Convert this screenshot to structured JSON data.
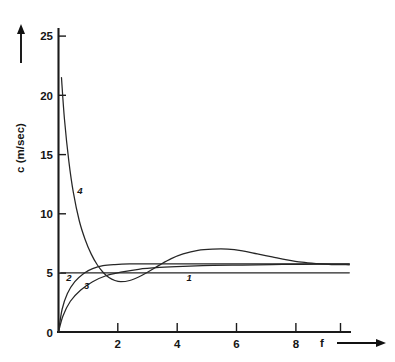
{
  "chart_data": {
    "type": "line",
    "title": "",
    "subtitle": "",
    "xlabel": "f",
    "ylabel": "c (m/sec)",
    "xlim": [
      0,
      11.2
    ],
    "ylim": [
      0,
      26.5
    ],
    "xticks": [
      0,
      2,
      4,
      6,
      8
    ],
    "xtick_labels": [
      "0",
      "2",
      "4",
      "6",
      "8"
    ],
    "yticks": [
      0,
      5,
      10,
      15,
      20,
      25
    ],
    "ytick_labels": [
      "0",
      "5",
      "10",
      "15",
      "20",
      "25"
    ],
    "grid": false,
    "legend_position": "inline-curve-labels",
    "axis_arrows": {
      "x": "right",
      "y": "up"
    },
    "series": [
      {
        "name": "1",
        "label": "1",
        "label_at": {
          "x": 4.4,
          "y": 4.35
        },
        "description": "constant horizontal line",
        "x": [
          0.08,
          1.0,
          2.0,
          3.0,
          4.0,
          5.0,
          6.0,
          7.0,
          8.0,
          9.0,
          9.8
        ],
        "y": [
          5.0,
          5.0,
          5.0,
          5.0,
          5.0,
          5.0,
          5.0,
          5.0,
          5.0,
          5.0,
          5.0
        ]
      },
      {
        "name": "2",
        "label": "2",
        "label_at": {
          "x": 0.35,
          "y": 4.3
        },
        "description": "steep rise from origin then plateau near 5.75",
        "x": [
          0.0,
          0.12,
          0.3,
          0.55,
          0.85,
          1.15,
          1.5,
          1.9,
          2.4,
          3.0,
          4.0,
          5.0,
          6.0,
          7.0,
          8.0,
          9.0,
          9.8
        ],
        "y": [
          0.0,
          1.9,
          3.25,
          4.25,
          4.95,
          5.35,
          5.6,
          5.7,
          5.75,
          5.75,
          5.75,
          5.75,
          5.75,
          5.75,
          5.75,
          5.75,
          5.75
        ]
      },
      {
        "name": "3",
        "label": "3",
        "label_at": {
          "x": 0.95,
          "y": 3.6
        },
        "description": "slower rise from origin, approaches 5.75 asymptotically",
        "x": [
          0.0,
          0.15,
          0.4,
          0.75,
          1.15,
          1.6,
          2.1,
          2.7,
          3.4,
          4.2,
          5.2,
          6.2,
          7.2,
          8.2,
          9.0,
          9.8
        ],
        "y": [
          0.0,
          1.35,
          2.6,
          3.55,
          4.25,
          4.75,
          5.05,
          5.3,
          5.45,
          5.55,
          5.62,
          5.66,
          5.7,
          5.72,
          5.73,
          5.74
        ]
      },
      {
        "name": "4",
        "label": "4",
        "label_at": {
          "x": 0.72,
          "y": 11.7
        },
        "description": "steep decay from 21.5, undershoot minimum 4.2 near f=2.1, overshoot maximum 7.0 near f=5.7, settles to 5.75",
        "x": [
          0.1,
          0.2,
          0.35,
          0.5,
          0.7,
          0.9,
          1.1,
          1.3,
          1.5,
          1.7,
          1.9,
          2.1,
          2.4,
          2.7,
          3.0,
          3.4,
          3.8,
          4.2,
          4.7,
          5.2,
          5.7,
          6.2,
          6.7,
          7.2,
          7.7,
          8.2,
          8.7,
          9.2,
          9.8
        ],
        "y": [
          21.5,
          18.0,
          14.4,
          11.8,
          9.4,
          7.8,
          6.6,
          5.7,
          5.05,
          4.6,
          4.35,
          4.25,
          4.35,
          4.65,
          5.05,
          5.65,
          6.2,
          6.6,
          6.9,
          7.0,
          7.0,
          6.85,
          6.6,
          6.35,
          6.1,
          5.9,
          5.78,
          5.7,
          5.68
        ]
      }
    ]
  },
  "axis": {
    "x_title": "f",
    "y_title": "c (m/sec)"
  }
}
